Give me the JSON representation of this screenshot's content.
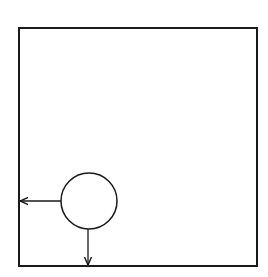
{
  "canvas": {
    "width": 268,
    "height": 277,
    "background": "#ffffff"
  },
  "colors": {
    "stroke": "#1a1a1a"
  },
  "diagram": {
    "boundary": {
      "shape": "square",
      "x": 19,
      "y": 28,
      "width": 238,
      "height": 238,
      "stroke_width": 2
    },
    "body": {
      "shape": "circle",
      "cx": 89,
      "cy": 201,
      "r": 28,
      "stroke_width": 1.5
    },
    "arrows": [
      {
        "name": "leftward-arrow",
        "x1": 61,
        "y1": 201,
        "x2": 20,
        "y2": 201,
        "direction": "left"
      },
      {
        "name": "downward-arrow",
        "x1": 88,
        "y1": 229,
        "x2": 88,
        "y2": 265,
        "direction": "down"
      }
    ]
  }
}
